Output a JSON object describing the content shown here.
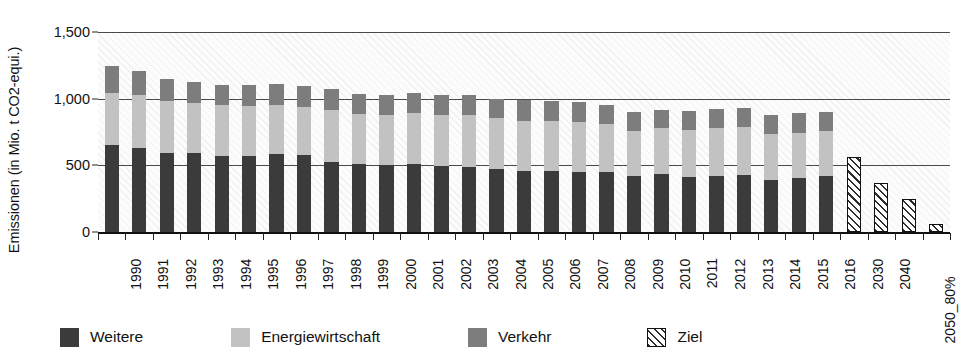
{
  "chart_data": {
    "type": "bar",
    "subtype": "stacked-bar",
    "title": "",
    "xlabel": "",
    "ylabel": "Emissionen (in Mio. t CO2-equi.)",
    "ylim": [
      0,
      1500
    ],
    "yticks": [
      0,
      500,
      1000,
      1500
    ],
    "ytick_labels": [
      "0",
      "500",
      "1,000",
      "1,500"
    ],
    "grid": true,
    "grid_axis": "y",
    "legend_position": "bottom",
    "categories": [
      "1990",
      "1991",
      "1992",
      "1993",
      "1994",
      "1995",
      "1996",
      "1997",
      "1998",
      "1999",
      "2000",
      "2001",
      "2002",
      "2003",
      "2004",
      "2005",
      "2006",
      "2007",
      "2008",
      "2009",
      "2010",
      "2011",
      "2012",
      "2013",
      "2014",
      "2015",
      "2016",
      "2030",
      "2040",
      "2050_80%",
      "2050_95%"
    ],
    "series": [
      {
        "name": "Weitere",
        "color": "#3b3b3b",
        "values": [
          650,
          630,
          595,
          595,
          570,
          570,
          585,
          575,
          525,
          510,
          505,
          510,
          495,
          490,
          475,
          455,
          455,
          450,
          450,
          420,
          435,
          415,
          420,
          425,
          390,
          405,
          420,
          null,
          null,
          null,
          null
        ]
      },
      {
        "name": "Energiewirtschaft",
        "color": "#c2c2c2",
        "values": [
          395,
          395,
          390,
          375,
          380,
          375,
          370,
          365,
          390,
          375,
          375,
          385,
          385,
          390,
          380,
          380,
          380,
          375,
          360,
          340,
          345,
          350,
          360,
          365,
          345,
          340,
          335,
          null,
          null,
          null,
          null
        ]
      },
      {
        "name": "Verkehr",
        "color": "#7d7d7d",
        "values": [
          200,
          180,
          165,
          155,
          155,
          160,
          155,
          155,
          160,
          150,
          150,
          145,
          145,
          145,
          145,
          155,
          150,
          150,
          145,
          140,
          135,
          140,
          140,
          140,
          145,
          145,
          145,
          null,
          null,
          null,
          null
        ]
      },
      {
        "name": "Ziel",
        "color": "#ffffff",
        "hatched": true,
        "values": [
          null,
          null,
          null,
          null,
          null,
          null,
          null,
          null,
          null,
          null,
          null,
          null,
          null,
          null,
          null,
          null,
          null,
          null,
          null,
          null,
          null,
          null,
          null,
          null,
          null,
          null,
          null,
          560,
          370,
          250,
          62
        ]
      }
    ],
    "totals": [
      1245,
      1205,
      1150,
      1125,
      1105,
      1105,
      1110,
      1095,
      1075,
      1035,
      1030,
      1040,
      1025,
      1025,
      1000,
      990,
      985,
      975,
      955,
      900,
      915,
      905,
      920,
      930,
      880,
      890,
      900,
      560,
      370,
      250,
      62
    ]
  },
  "legend": {
    "items": [
      {
        "label": "Weitere",
        "swatch": "solid-dark-gray-swatch"
      },
      {
        "label": "Energiewirtschaft",
        "swatch": "solid-light-gray-swatch"
      },
      {
        "label": "Verkehr",
        "swatch": "solid-medium-gray-swatch"
      },
      {
        "label": "Ziel",
        "swatch": "diagonal-hatch-swatch"
      }
    ]
  }
}
